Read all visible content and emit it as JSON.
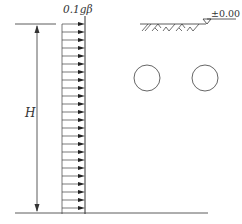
{
  "diagram": {
    "load_label": "0.1gβ",
    "height_label": "H",
    "elevation_label": "±0.00",
    "colors": {
      "stroke": "#333333",
      "circle": "#555555",
      "background": "#ffffff"
    },
    "load": {
      "type": "uniform-distributed",
      "x_left": 62,
      "x_right": 85,
      "y_top": 16,
      "y_bottom": 214,
      "arrow_count": 24,
      "arrow_spacing": 8,
      "first_arrow_y": 24,
      "direction": "right"
    },
    "dimension": {
      "x": 37,
      "y_top": 24,
      "y_bottom": 213
    },
    "ground": {
      "x_start": 140,
      "x_end": 208,
      "y": 24
    },
    "base_line": {
      "x_start": 15,
      "x_end": 208,
      "y": 213
    },
    "openings": [
      {
        "cx": 147,
        "cy": 78,
        "r": 13
      },
      {
        "cx": 205,
        "cy": 78,
        "r": 13
      }
    ]
  }
}
